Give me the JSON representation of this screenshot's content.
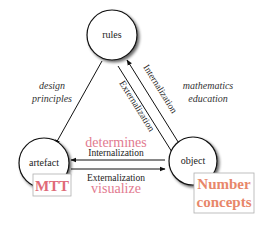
{
  "diagram": {
    "nodes": {
      "rules": "rules",
      "artefact": "artefact",
      "object": "object"
    },
    "edges": {
      "left_label_line1": "design",
      "left_label_line2": "principles",
      "right_label_line1": "mathematics",
      "right_label_line2": "education",
      "diag_internalization": "Internalization",
      "diag_externalization": "Externalization",
      "bottom_internalization": "Internalization",
      "bottom_externalization": "Externalization"
    },
    "annotations": {
      "determines": "determines",
      "visualize": "visualize",
      "artefact_box": "MTT",
      "object_box_line1": "Number",
      "object_box_line2": "concepts"
    },
    "colors": {
      "pink": "#e27a8f",
      "orange": "#e8876a",
      "box_border": "#b0b0b0",
      "line": "#111111"
    }
  }
}
